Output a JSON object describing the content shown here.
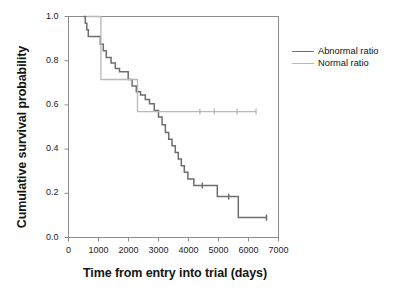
{
  "chart_data": {
    "type": "line",
    "subtype": "kaplan-meier-step",
    "title": "",
    "xlabel": "Time from entry into trial (days)",
    "ylabel": "Cumulative survival probability",
    "xlim": [
      0,
      7000
    ],
    "ylim": [
      0.0,
      1.0
    ],
    "xticks": [
      0,
      1000,
      2000,
      3000,
      4000,
      5000,
      6000,
      7000
    ],
    "yticks": [
      0.0,
      0.2,
      0.4,
      0.6,
      0.8,
      1.0
    ],
    "xtick_labels": [
      "0",
      "1000",
      "2000",
      "3000",
      "4000",
      "5000",
      "6000",
      "7000"
    ],
    "ytick_labels": [
      "0.0",
      "0.2",
      "0.4",
      "0.6",
      "0.8",
      "1.0"
    ],
    "grid": false,
    "legend_position": "right",
    "series": [
      {
        "name": "Abnormal ratio",
        "color": "#6e6e6e",
        "linewidth": 1.5,
        "steps": [
          [
            500,
            1.0
          ],
          [
            560,
            0.97
          ],
          [
            610,
            0.94
          ],
          [
            660,
            0.91
          ],
          [
            980,
            0.91
          ],
          [
            1060,
            0.875
          ],
          [
            1160,
            0.845
          ],
          [
            1260,
            0.815
          ],
          [
            1420,
            0.79
          ],
          [
            1560,
            0.765
          ],
          [
            1700,
            0.75
          ],
          [
            1900,
            0.75
          ],
          [
            1990,
            0.715
          ],
          [
            2120,
            0.685
          ],
          [
            2260,
            0.66
          ],
          [
            2400,
            0.645
          ],
          [
            2560,
            0.625
          ],
          [
            2700,
            0.605
          ],
          [
            2860,
            0.575
          ],
          [
            3000,
            0.545
          ],
          [
            3120,
            0.51
          ],
          [
            3230,
            0.475
          ],
          [
            3340,
            0.445
          ],
          [
            3450,
            0.415
          ],
          [
            3560,
            0.385
          ],
          [
            3660,
            0.355
          ],
          [
            3760,
            0.325
          ],
          [
            3860,
            0.295
          ],
          [
            3980,
            0.265
          ],
          [
            4180,
            0.235
          ],
          [
            4900,
            0.235
          ],
          [
            4960,
            0.185
          ],
          [
            5600,
            0.185
          ],
          [
            5660,
            0.09
          ],
          [
            6600,
            0.09
          ]
        ],
        "censor_marks": [
          [
            4460,
            0.235
          ],
          [
            5340,
            0.185
          ],
          [
            6600,
            0.09
          ]
        ]
      },
      {
        "name": "Normal ratio",
        "color": "#b9b9b9",
        "linewidth": 1.3,
        "steps": [
          [
            620,
            1.0
          ],
          [
            1060,
            1.0
          ],
          [
            1080,
            0.715
          ],
          [
            2260,
            0.715
          ],
          [
            2300,
            0.57
          ],
          [
            6250,
            0.57
          ]
        ],
        "censor_marks": [
          [
            4380,
            0.57
          ],
          [
            4860,
            0.57
          ],
          [
            5620,
            0.57
          ],
          [
            6250,
            0.57
          ]
        ]
      }
    ]
  },
  "legend": {
    "entries": [
      {
        "label": "Abnormal ratio",
        "color": "#6e6e6e"
      },
      {
        "label": "Normal ratio",
        "color": "#b9b9b9"
      }
    ]
  },
  "axes": {
    "frame_color": "#8c8c8c"
  }
}
